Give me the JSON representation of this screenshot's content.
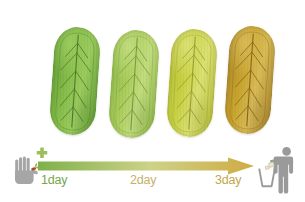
{
  "figure": {
    "background_color": "#ffffff"
  },
  "samples": [
    {
      "id": "pad-day0",
      "label": "fresh green pad",
      "color": "#86bd4a",
      "color_dark": "#5f9b33",
      "color_light": "#9ccc5f",
      "vein_color": "#4d7f2a",
      "left": 52,
      "top": 27,
      "rotate": 4
    },
    {
      "id": "pad-day1",
      "label": "yellow-green pad",
      "color": "#a9cc5a",
      "color_dark": "#8fb94a",
      "color_light": "#c2dd7e",
      "vein_color": "#7c9e3e",
      "left": 111,
      "top": 30,
      "rotate": 4
    },
    {
      "id": "pad-day2",
      "label": "yellow pad",
      "color": "#c9d243",
      "color_dark": "#b6bf38",
      "color_light": "#dbe173",
      "vein_color": "#9aa233",
      "left": 169,
      "top": 29,
      "rotate": 4
    },
    {
      "id": "pad-day3",
      "label": "golden brown degraded pad",
      "color": "#c9a52e",
      "color_dark": "#a8842a",
      "color_light": "#d9bb56",
      "vein_color": "#8a6a1e",
      "left": 227,
      "top": 26,
      "rotate": 4
    }
  ],
  "timeline": {
    "arrow": {
      "gradient_start": "#7fb04a",
      "gradient_mid": "#cdd288",
      "gradient_end": "#d0ab43"
    },
    "labels": [
      {
        "id": "day1",
        "text": "1day",
        "color": "#76a64a"
      },
      {
        "id": "day2",
        "text": "2day",
        "color": "#c6b069"
      },
      {
        "id": "day3",
        "text": "3day",
        "color": "#c5a64e"
      }
    ]
  },
  "icons": {
    "start": {
      "name": "hand-planting-seed-icon",
      "description": "gray hand holding a small sprout with a plus sign",
      "hand_color": "#a6a6a6",
      "plus_color": "#9cbf5a",
      "sprout_leaf_color": "#8fbf4a",
      "sprout_seed_color": "#b0472f"
    },
    "end": {
      "name": "person-throwing-litter-bin-icon",
      "description": "gray person dropping waste into a trash bin",
      "figure_color": "#9a9a9a",
      "bin_color": "#9a9a9a",
      "litter_color": "#e8dfc8"
    }
  }
}
